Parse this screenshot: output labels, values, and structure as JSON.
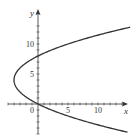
{
  "chart_data": {
    "type": "line",
    "title": "",
    "xlabel": "x",
    "ylabel": "y",
    "xlim": [
      -5,
      15
    ],
    "ylim": [
      -5,
      14
    ],
    "x_ticks": [
      0,
      5,
      10
    ],
    "y_ticks": [
      5,
      10
    ],
    "x_tick_labels": [
      "0",
      "5",
      "10"
    ],
    "y_tick_labels": [
      "5",
      "10"
    ],
    "grid": false,
    "legend": null,
    "series": [
      {
        "name": "parabola x = y^2/4 - 2y",
        "equation": "x = (y - 4)^2 / 4 - 4",
        "vertex": [
          -4,
          4
        ],
        "y_intercepts": [
          0,
          8
        ],
        "points": [
          [
            14.8,
            12.8
          ],
          [
            10,
            11.2
          ],
          [
            5,
            9.8
          ],
          [
            0,
            8
          ],
          [
            -2,
            6.8
          ],
          [
            -3,
            6
          ],
          [
            -4,
            4
          ],
          [
            -3,
            2
          ],
          [
            -2,
            1.2
          ],
          [
            0,
            0
          ],
          [
            5,
            -1.8
          ],
          [
            10,
            -3.2
          ],
          [
            14.7,
            -4.7
          ]
        ],
        "color": "#333333"
      }
    ]
  }
}
